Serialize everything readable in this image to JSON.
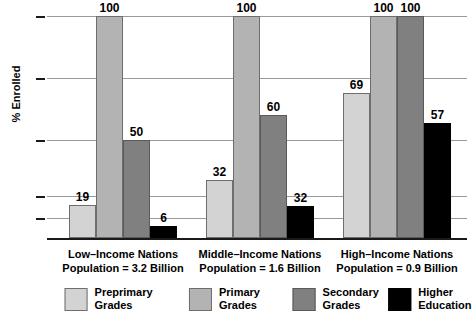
{
  "chart_data": {
    "type": "bar",
    "title": "",
    "xlabel": "",
    "ylabel": "% Enrolled",
    "ylim": [
      0,
      100
    ],
    "grid": true,
    "legend_position": "bottom",
    "ytick_labels": [
      "100",
      "75",
      "50",
      "25",
      "10"
    ],
    "ytick_values": [
      100,
      75,
      50,
      25,
      10
    ],
    "categories": [
      "Low–Income Nations",
      "Middle–Income Nations",
      "High–Income Nations"
    ],
    "category_sublabels": [
      "Population = 3.2 Billion",
      "Population = 1.6 Billion",
      "Population = 0.9 Billion"
    ],
    "series": [
      {
        "name": "Preprimary Grades",
        "color": "#d3d3d3",
        "values": [
          19,
          32,
          69
        ],
        "draw_values": [
          19,
          32,
          69
        ]
      },
      {
        "name": "Primary Grades",
        "color": "#b3b3b3",
        "values": [
          100,
          100,
          100
        ],
        "draw_values": [
          100,
          100,
          100
        ]
      },
      {
        "name": "Secondary Grades",
        "color": "#808080",
        "values": [
          50,
          60,
          100
        ],
        "draw_values": [
          50,
          60,
          100
        ]
      },
      {
        "name": "Higher Education",
        "color": "#000000",
        "values": [
          6,
          32,
          57
        ],
        "draw_values": [
          6,
          18,
          57
        ]
      }
    ],
    "legend": [
      {
        "label_line1": "Preprimary",
        "label_line2": "Grades",
        "color": "#d3d3d3"
      },
      {
        "label_line1": "Primary",
        "label_line2": "Grades",
        "color": "#b3b3b3"
      },
      {
        "label_line1": "Secondary",
        "label_line2": "Grades",
        "color": "#808080"
      },
      {
        "label_line1": "Higher",
        "label_line2": "Education",
        "color": "#000000"
      }
    ]
  }
}
